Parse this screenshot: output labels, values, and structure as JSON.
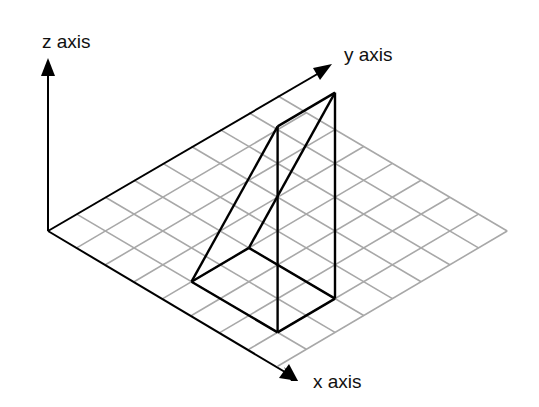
{
  "diagram": {
    "title": "",
    "labels": {
      "z_axis": "z axis",
      "y_axis": "y axis",
      "x_axis": "x axis"
    },
    "grid": {
      "cells_x": 8,
      "cells_y": 8,
      "color": "#a8a8a8"
    },
    "shape": {
      "type": "triangular wedge",
      "base_rectangle": {
        "x_range": [
          4,
          7
        ],
        "y_range": [
          1,
          3
        ]
      },
      "vertices": {
        "A": [
          4,
          1,
          0
        ],
        "B": [
          4,
          3,
          0
        ],
        "C": [
          7,
          1,
          0
        ],
        "D": [
          7,
          3,
          0
        ],
        "E": [
          7,
          1,
          "h"
        ],
        "F": [
          7,
          3,
          "h"
        ]
      },
      "color": "#000000"
    },
    "axis_color": "#000000"
  }
}
